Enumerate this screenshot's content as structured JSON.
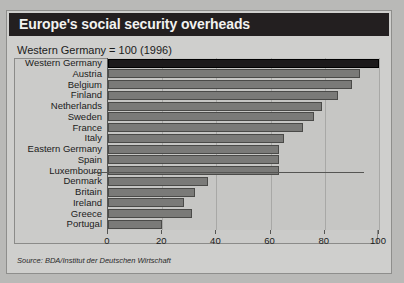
{
  "header": {
    "title": "Europe's social security overheads"
  },
  "subtitle": "Western Germany = 100 (1996)",
  "source": "Source: BDA/Institut der Deutschen Wirtschaft",
  "axis": {
    "ticks": [
      "0",
      "20",
      "40",
      "60",
      "80",
      "100"
    ]
  },
  "colors": {
    "title_bar": "#231f20",
    "panel": "#cfcfcd",
    "plot": "#c6c6c4",
    "bar": "#7a7a78",
    "bar_highlight": "#1c1a1b",
    "grid": "#a8a8a6",
    "axis": "#555553"
  },
  "chart_data": {
    "type": "bar",
    "orientation": "horizontal",
    "title": "Europe's social security overheads",
    "subtitle": "Western Germany = 100 (1996)",
    "xlabel": "",
    "ylabel": "",
    "xlim": [
      0,
      100
    ],
    "xticks": [
      0,
      20,
      40,
      60,
      80,
      100
    ],
    "grid": true,
    "legend": "none",
    "source": "Source: BDA/Institut der Deutschen Wirtschaft",
    "categories": [
      "Western Germany",
      "Austria",
      "Belgium",
      "Finland",
      "Netherlands",
      "Sweden",
      "France",
      "Italy",
      "Eastern Germany",
      "Spain",
      "Luxembourg",
      "Denmark",
      "Britain",
      "Ireland",
      "Greece",
      "Portugal"
    ],
    "values": [
      100,
      93,
      90,
      85,
      79,
      76,
      72,
      65,
      63,
      63,
      63,
      37,
      32,
      28,
      31,
      20
    ],
    "highlight_index": 0
  }
}
